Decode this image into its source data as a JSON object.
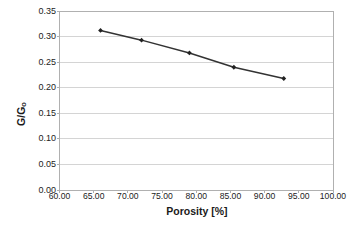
{
  "chart_data": {
    "type": "line",
    "title": "",
    "xlabel": "Porosity [%]",
    "ylabel": "G/G₀",
    "ylabel_main": "G/G",
    "ylabel_sub": "o",
    "x": [
      66.0,
      72.0,
      79.0,
      85.5,
      92.8
    ],
    "values": [
      0.312,
      0.293,
      0.268,
      0.24,
      0.218
    ],
    "series": [
      {
        "name": "G/Go vs Porosity",
        "x": [
          66.0,
          72.0,
          79.0,
          85.5,
          92.8
        ],
        "values": [
          0.312,
          0.293,
          0.268,
          0.24,
          0.218
        ]
      }
    ],
    "xlim": [
      60.0,
      100.0
    ],
    "ylim": [
      0.0,
      0.35
    ],
    "xticks": [
      60.0,
      65.0,
      70.0,
      75.0,
      80.0,
      85.0,
      90.0,
      95.0,
      100.0
    ],
    "yticks": [
      0.0,
      0.05,
      0.1,
      0.15,
      0.2,
      0.25,
      0.3,
      0.35
    ],
    "xtick_labels": [
      "60.00",
      "65.00",
      "70.00",
      "75.00",
      "80.00",
      "85.00",
      "90.00",
      "95.00",
      "100.00"
    ],
    "ytick_labels": [
      "0.00",
      "0.05",
      "0.10",
      "0.15",
      "0.20",
      "0.25",
      "0.30",
      "0.35"
    ],
    "grid": "horizontal",
    "legend": "none",
    "marker": "diamond",
    "line_color": "#333333",
    "marker_color": "#222222",
    "grid_color": "#d4d4d4",
    "axis_color": "#b0b0b0",
    "background": "#ffffff"
  }
}
